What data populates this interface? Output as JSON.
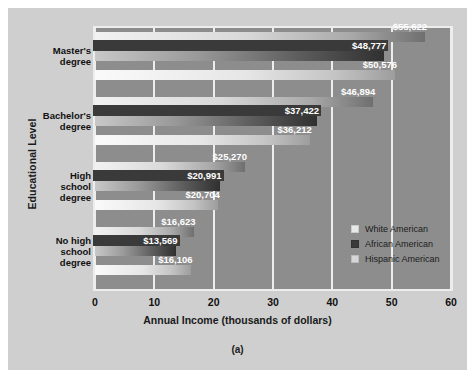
{
  "figure": {
    "caption": "(a)"
  },
  "chart_data": {
    "type": "bar",
    "orientation": "horizontal",
    "title": "",
    "xlabel": "Annual Income (thousands of dollars)",
    "ylabel": "Educational Level",
    "xlim": [
      0,
      60
    ],
    "xticks": [
      "0",
      "10",
      "20",
      "30",
      "40",
      "50",
      "60"
    ],
    "xtick_values": [
      0,
      10,
      20,
      30,
      40,
      50,
      60
    ],
    "grid": true,
    "grid_axis": "x",
    "legend_position": "inside-right-lower",
    "categories": [
      "Master's degree",
      "Bachelor's degree",
      "High school degree",
      "No high school degree"
    ],
    "series": [
      {
        "name": "White American",
        "color": "#e8e8e8",
        "values": [
          55.622,
          46.894,
          25.27,
          16.623
        ],
        "labels": [
          "$55,622",
          "$46,894",
          "$25,270",
          "$16,623"
        ]
      },
      {
        "name": "African American",
        "color": "#3a3a3a",
        "values": [
          48.777,
          37.422,
          20.991,
          13.569
        ],
        "labels": [
          "$48,777",
          "$37,422",
          "$20,991",
          "$13,569"
        ]
      },
      {
        "name": "Hispanic American",
        "color": "#d6d6d6",
        "values": [
          50.576,
          36.212,
          20.704,
          16.106
        ],
        "labels": [
          "$50,576",
          "$36,212",
          "$20,704",
          "$16,106"
        ]
      }
    ]
  },
  "category_labels": [
    {
      "lines": "Master's\ndegree"
    },
    {
      "lines": "Bachelor's\ndegree"
    },
    {
      "lines": "High\nschool\ndegree"
    },
    {
      "lines": "No high\nschool\ndegree"
    }
  ],
  "colors": {
    "page_background": "#ffffff",
    "canvas_background": "#cfcfcf",
    "plot_background": "#8d8d8d",
    "gridline": "#ededed",
    "text": "#111111",
    "value_label_text": "#ffffff",
    "value_label_dark_bg": "#3a3a3a"
  }
}
